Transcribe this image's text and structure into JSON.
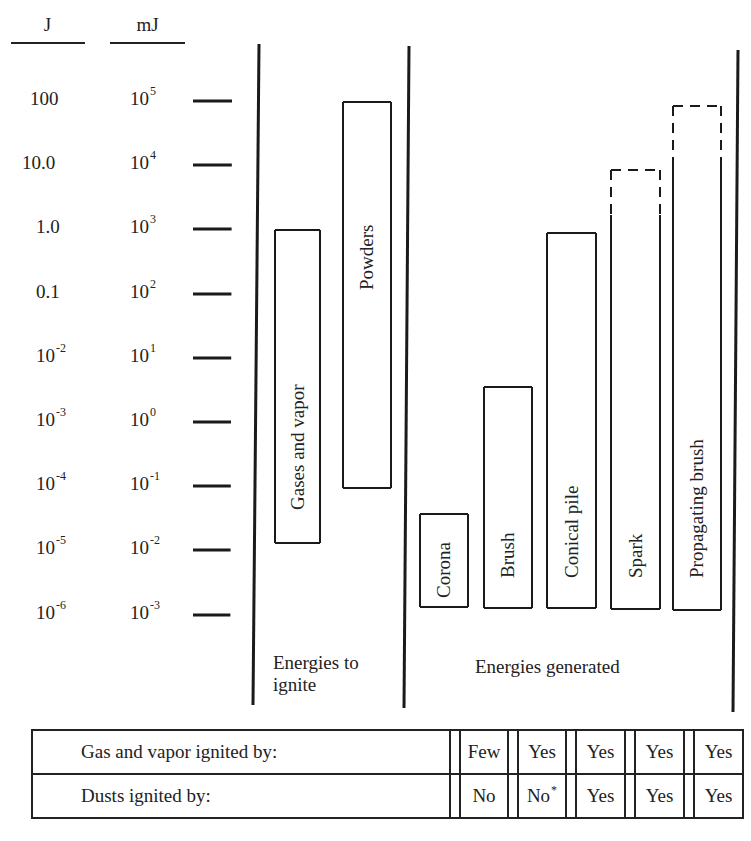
{
  "axis": {
    "col_headers": {
      "joules": "J",
      "millijoules": "mJ"
    },
    "ticks": [
      {
        "j": "100",
        "j_exp": "",
        "mj": "10",
        "mj_exp": "5",
        "y": 101
      },
      {
        "j": "10.0",
        "j_exp": "",
        "mj": "10",
        "mj_exp": "4",
        "y": 165
      },
      {
        "j": "1.0",
        "j_exp": "",
        "mj": "10",
        "mj_exp": "3",
        "y": 229
      },
      {
        "j": "0.1",
        "j_exp": "",
        "mj": "10",
        "mj_exp": "2",
        "y": 294
      },
      {
        "j": "10",
        "j_exp": "-2",
        "mj": "10",
        "mj_exp": "1",
        "y": 358
      },
      {
        "j": "10",
        "j_exp": "-3",
        "mj": "10",
        "mj_exp": "0",
        "y": 422
      },
      {
        "j": "10",
        "j_exp": "-4",
        "mj": "10",
        "mj_exp": "-1",
        "y": 486
      },
      {
        "j": "10",
        "j_exp": "-5",
        "mj": "10",
        "mj_exp": "-2",
        "y": 550
      },
      {
        "j": "10",
        "j_exp": "-6",
        "mj": "10",
        "mj_exp": "-3",
        "y": 615
      }
    ]
  },
  "sections": {
    "ignite": {
      "label_line1": "Energies to",
      "label_line2": "ignite"
    },
    "generated": {
      "label": "Energies generated"
    }
  },
  "chart_data": {
    "type": "range-bar",
    "title": "",
    "y_axis": {
      "label_left": "J",
      "label_right": "mJ",
      "scale": "log10",
      "range_mJ": [
        0.001,
        100000
      ],
      "tick_labels_J": [
        "100",
        "10.0",
        "1.0",
        "0.1",
        "10^-2",
        "10^-3",
        "10^-4",
        "10^-5",
        "10^-6"
      ],
      "tick_labels_mJ": [
        "10^5",
        "10^4",
        "10^3",
        "10^2",
        "10^1",
        "10^0",
        "10^-1",
        "10^-2",
        "10^-3"
      ]
    },
    "groups": [
      {
        "name": "Energies to ignite",
        "bars": [
          {
            "label": "Gases and vapor",
            "min_mJ": 0.012,
            "max_mJ": 1000,
            "dashed_top": false
          },
          {
            "label": "Powders",
            "min_mJ": 0.1,
            "max_mJ": 100000,
            "dashed_top": false
          }
        ]
      },
      {
        "name": "Energies generated",
        "bars": [
          {
            "label": "Corona",
            "min_mJ": 0.001,
            "max_mJ": 0.03,
            "dashed_top": false
          },
          {
            "label": "Brush",
            "min_mJ": 0.001,
            "max_mJ": 3,
            "dashed_top": false
          },
          {
            "label": "Conical pile",
            "min_mJ": 0.001,
            "max_mJ": 1000,
            "dashed_top": false
          },
          {
            "label": "Spark",
            "min_mJ": 0.001,
            "max_mJ": 10000,
            "solid_max_mJ": 2000,
            "dashed_top": true
          },
          {
            "label": "Propagating brush",
            "min_mJ": 0.001,
            "max_mJ": 100000,
            "solid_max_mJ": 10000,
            "dashed_top": true
          }
        ]
      }
    ],
    "table": {
      "columns": [
        "Corona",
        "Brush",
        "Conical pile",
        "Spark",
        "Propagating brush"
      ],
      "rows": [
        {
          "label": "Gas and vapor ignited by:",
          "values": [
            "Few",
            "Yes",
            "Yes",
            "Yes",
            "Yes"
          ]
        },
        {
          "label": "Dusts ignited by:",
          "values": [
            "No",
            "No*",
            "Yes",
            "Yes",
            "Yes"
          ]
        }
      ]
    }
  },
  "bars": [
    {
      "label": "Gases and vapor",
      "x": 275,
      "w": 45,
      "top": 230,
      "bottom": 543,
      "dash_to": null,
      "text_bottom": 510
    },
    {
      "label": "Powders",
      "x": 343,
      "w": 48,
      "top": 102,
      "bottom": 488,
      "dash_to": null,
      "text_bottom": 290
    },
    {
      "label": "Corona",
      "x": 420,
      "w": 48,
      "top": 514,
      "bottom": 607,
      "dash_to": null,
      "text_bottom": 598
    },
    {
      "label": "Brush",
      "x": 484,
      "w": 48,
      "top": 387,
      "bottom": 608,
      "dash_to": null,
      "text_bottom": 578
    },
    {
      "label": "Conical pile",
      "x": 547,
      "w": 49,
      "top": 233,
      "bottom": 608,
      "dash_to": null,
      "text_bottom": 578
    },
    {
      "label": "Spark",
      "x": 611,
      "w": 49,
      "top": 170,
      "bottom": 609,
      "dash_to": 215,
      "text_bottom": 578
    },
    {
      "label": "Propagating brush",
      "x": 673,
      "w": 48,
      "top": 106,
      "bottom": 610,
      "dash_to": 160,
      "text_bottom": 578
    }
  ],
  "table": {
    "rows": [
      {
        "label": "Gas and vapor ignited by:",
        "cells": [
          "Few",
          "Yes",
          "Yes",
          "Yes",
          "Yes"
        ]
      },
      {
        "label": "Dusts ignited by:",
        "cells": [
          "No",
          "No",
          "Yes",
          "Yes",
          "Yes"
        ],
        "footnote_cell": 1,
        "footnote_mark": "*"
      }
    ]
  }
}
